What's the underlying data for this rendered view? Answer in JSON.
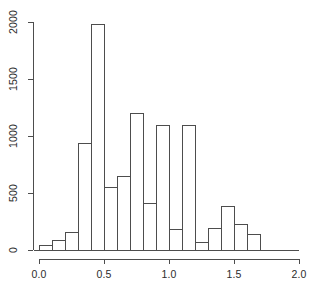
{
  "chart_data": {
    "type": "bar",
    "title": "",
    "subtitle": "",
    "xlabel": "",
    "ylabel": "",
    "grid": false,
    "legend": null,
    "bin_width": 0.1,
    "xlim": [
      0.0,
      2.0
    ],
    "ylim": [
      0,
      2000
    ],
    "xticks": [
      "0.0",
      "0.5",
      "1.0",
      "1.5",
      "2.0"
    ],
    "xtick_values": [
      0.0,
      0.5,
      1.0,
      1.5,
      2.0
    ],
    "yticks": [
      "0",
      "500",
      "1000",
      "1500",
      "2000"
    ],
    "ytick_values": [
      0,
      500,
      1000,
      1500,
      2000
    ],
    "bin_edges": [
      0.0,
      0.1,
      0.2,
      0.3,
      0.4,
      0.5,
      0.6,
      0.7,
      0.8,
      0.9,
      1.0,
      1.1,
      1.2,
      1.3,
      1.4,
      1.5,
      1.6,
      1.7
    ],
    "categories": [
      "0.0-0.1",
      "0.1-0.2",
      "0.2-0.3",
      "0.3-0.4",
      "0.4-0.5",
      "0.5-0.6",
      "0.6-0.7",
      "0.7-0.8",
      "0.8-0.9",
      "0.9-1.0",
      "1.0-1.1",
      "1.1-1.2",
      "1.2-1.3",
      "1.3-1.4",
      "1.4-1.5",
      "1.5-1.6",
      "1.6-1.7"
    ],
    "values": [
      45,
      90,
      160,
      935,
      1980,
      550,
      650,
      1200,
      415,
      1100,
      185,
      1100,
      70,
      195,
      385,
      230,
      140
    ]
  },
  "style": {
    "axis_color": "#4d4d4d",
    "bar_stroke": "#4d4d4d",
    "bar_fill": "transparent",
    "background": "#ffffff",
    "text_color": "#2b2b2b"
  }
}
